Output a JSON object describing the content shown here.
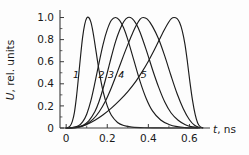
{
  "chart_data": {
    "type": "line",
    "title": "",
    "subtitle": "",
    "xlabel_var": "t",
    "xlabel_unit": ", ns",
    "ylabel_var": "U",
    "ylabel_unit": ", rel. units",
    "xlim": [
      -0.03,
      0.7
    ],
    "ylim": [
      0,
      1.05
    ],
    "xticks": [
      0,
      0.2,
      0.4,
      0.6
    ],
    "xticklabels": [
      "0",
      "0.2",
      "0.4",
      "0.6"
    ],
    "xminorticks": [
      0.1,
      0.3,
      0.5
    ],
    "yticks": [
      0,
      0.2,
      0.4,
      0.6,
      0.8,
      1.0
    ],
    "yticklabels": [
      "0",
      "0.2",
      "0.4",
      "0.6",
      "0.8",
      "1.0"
    ],
    "yminorticks": [
      0.1,
      0.3,
      0.5,
      0.7,
      0.9
    ],
    "grid": false,
    "legend": "inline-curve-numbers",
    "legend_position": "inline",
    "line_color": "#1c1c1c",
    "axis_color": "#3a3a3a",
    "background": "#fdfdfd",
    "annotations": [
      {
        "label": "1",
        "x": 0.048,
        "y": 0.45
      },
      {
        "label": "2",
        "x": 0.172,
        "y": 0.45
      },
      {
        "label": "3",
        "x": 0.218,
        "y": 0.45
      },
      {
        "label": "4",
        "x": 0.268,
        "y": 0.45
      },
      {
        "label": "5",
        "x": 0.378,
        "y": 0.45
      }
    ],
    "series": [
      {
        "name": "1",
        "peak_t": 0.105,
        "points": [
          [
            0.0,
            0.0
          ],
          [
            0.01,
            0.005
          ],
          [
            0.02,
            0.02
          ],
          [
            0.03,
            0.06
          ],
          [
            0.04,
            0.14
          ],
          [
            0.05,
            0.28
          ],
          [
            0.06,
            0.46
          ],
          [
            0.07,
            0.65
          ],
          [
            0.08,
            0.82
          ],
          [
            0.09,
            0.935
          ],
          [
            0.1,
            0.995
          ],
          [
            0.11,
            1.0
          ],
          [
            0.12,
            0.96
          ],
          [
            0.13,
            0.875
          ],
          [
            0.14,
            0.76
          ],
          [
            0.16,
            0.52
          ],
          [
            0.18,
            0.33
          ],
          [
            0.2,
            0.2
          ],
          [
            0.22,
            0.115
          ],
          [
            0.25,
            0.05
          ],
          [
            0.28,
            0.022
          ],
          [
            0.32,
            0.008
          ],
          [
            0.38,
            0.002
          ],
          [
            0.45,
            0.001
          ],
          [
            0.56,
            0.0
          ],
          [
            0.64,
            0.0
          ]
        ]
      },
      {
        "name": "2",
        "peak_t": 0.24,
        "points": [
          [
            0.0,
            0.0
          ],
          [
            0.03,
            0.003
          ],
          [
            0.06,
            0.02
          ],
          [
            0.08,
            0.055
          ],
          [
            0.1,
            0.125
          ],
          [
            0.12,
            0.245
          ],
          [
            0.14,
            0.41
          ],
          [
            0.16,
            0.59
          ],
          [
            0.18,
            0.76
          ],
          [
            0.2,
            0.89
          ],
          [
            0.22,
            0.975
          ],
          [
            0.24,
            1.0
          ],
          [
            0.26,
            0.975
          ],
          [
            0.28,
            0.905
          ],
          [
            0.3,
            0.8
          ],
          [
            0.33,
            0.61
          ],
          [
            0.36,
            0.42
          ],
          [
            0.39,
            0.265
          ],
          [
            0.42,
            0.155
          ],
          [
            0.46,
            0.072
          ],
          [
            0.5,
            0.032
          ],
          [
            0.54,
            0.012
          ],
          [
            0.58,
            0.004
          ],
          [
            0.62,
            0.001
          ],
          [
            0.65,
            0.0
          ]
        ]
      },
      {
        "name": "3",
        "peak_t": 0.3,
        "points": [
          [
            0.0,
            0.0
          ],
          [
            0.04,
            0.003
          ],
          [
            0.08,
            0.022
          ],
          [
            0.11,
            0.065
          ],
          [
            0.14,
            0.15
          ],
          [
            0.16,
            0.24
          ],
          [
            0.18,
            0.36
          ],
          [
            0.2,
            0.5
          ],
          [
            0.22,
            0.645
          ],
          [
            0.24,
            0.78
          ],
          [
            0.26,
            0.885
          ],
          [
            0.28,
            0.962
          ],
          [
            0.3,
            1.0
          ],
          [
            0.32,
            0.992
          ],
          [
            0.34,
            0.945
          ],
          [
            0.36,
            0.865
          ],
          [
            0.39,
            0.705
          ],
          [
            0.42,
            0.53
          ],
          [
            0.45,
            0.37
          ],
          [
            0.48,
            0.235
          ],
          [
            0.51,
            0.138
          ],
          [
            0.545,
            0.07
          ],
          [
            0.58,
            0.03
          ],
          [
            0.615,
            0.01
          ],
          [
            0.65,
            0.002
          ]
        ]
      },
      {
        "name": "4",
        "peak_t": 0.36,
        "points": [
          [
            0.0,
            0.0
          ],
          [
            0.05,
            0.004
          ],
          [
            0.09,
            0.025
          ],
          [
            0.13,
            0.078
          ],
          [
            0.16,
            0.145
          ],
          [
            0.19,
            0.24
          ],
          [
            0.22,
            0.365
          ],
          [
            0.25,
            0.51
          ],
          [
            0.28,
            0.66
          ],
          [
            0.3,
            0.755
          ],
          [
            0.32,
            0.845
          ],
          [
            0.34,
            0.925
          ],
          [
            0.36,
            0.985
          ],
          [
            0.375,
            1.0
          ],
          [
            0.395,
            0.985
          ],
          [
            0.42,
            0.92
          ],
          [
            0.45,
            0.805
          ],
          [
            0.48,
            0.65
          ],
          [
            0.51,
            0.475
          ],
          [
            0.54,
            0.31
          ],
          [
            0.57,
            0.175
          ],
          [
            0.6,
            0.075
          ],
          [
            0.625,
            0.025
          ],
          [
            0.65,
            0.005
          ],
          [
            0.665,
            0.0
          ]
        ]
      },
      {
        "name": "5",
        "peak_t": 0.52,
        "points": [
          [
            0.0,
            0.0
          ],
          [
            0.06,
            0.01
          ],
          [
            0.1,
            0.032
          ],
          [
            0.14,
            0.07
          ],
          [
            0.18,
            0.12
          ],
          [
            0.22,
            0.18
          ],
          [
            0.26,
            0.25
          ],
          [
            0.3,
            0.33
          ],
          [
            0.34,
            0.425
          ],
          [
            0.37,
            0.51
          ],
          [
            0.4,
            0.605
          ],
          [
            0.43,
            0.71
          ],
          [
            0.455,
            0.805
          ],
          [
            0.478,
            0.89
          ],
          [
            0.498,
            0.955
          ],
          [
            0.512,
            0.99
          ],
          [
            0.525,
            1.0
          ],
          [
            0.54,
            0.99
          ],
          [
            0.552,
            0.955
          ],
          [
            0.565,
            0.88
          ],
          [
            0.578,
            0.76
          ],
          [
            0.59,
            0.6
          ],
          [
            0.602,
            0.42
          ],
          [
            0.615,
            0.25
          ],
          [
            0.628,
            0.12
          ],
          [
            0.64,
            0.045
          ],
          [
            0.652,
            0.012
          ],
          [
            0.665,
            0.002
          ]
        ]
      }
    ]
  }
}
